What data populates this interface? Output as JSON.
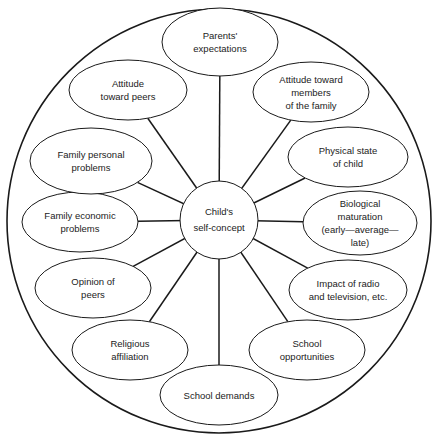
{
  "diagram": {
    "type": "radial-influence-diagram",
    "center": {
      "label": "Child's\nself-concept",
      "cx": 219,
      "cy": 220,
      "r": 39
    },
    "outer_circle": {
      "cx": 219,
      "cy": 221,
      "r": 212
    },
    "colors": {
      "stroke": "#1a1a1a",
      "fill": "#ffffff",
      "text": "#222222"
    },
    "nodes": [
      {
        "id": "parents-expectations",
        "label": "Parents'\nexpectations",
        "cx": 220,
        "cy": 42,
        "rx": 58,
        "ry": 34
      },
      {
        "id": "attitude-toward-members-family",
        "label": "Attitude toward\nmembers\nof the family",
        "cx": 311,
        "cy": 92,
        "rx": 58,
        "ry": 30
      },
      {
        "id": "physical-state-child",
        "label": "Physical state\nof child",
        "cx": 348,
        "cy": 157,
        "rx": 60,
        "ry": 30
      },
      {
        "id": "biological-maturation",
        "label": "Biological\nmaturation\n(early—average—\nlate)",
        "cx": 360,
        "cy": 223,
        "rx": 57,
        "ry": 32
      },
      {
        "id": "impact-radio-television",
        "label": "Impact of radio\nand television, etc.",
        "cx": 348,
        "cy": 290,
        "rx": 59,
        "ry": 30
      },
      {
        "id": "school-opportunities",
        "label": "School\nopportunities",
        "cx": 307,
        "cy": 350,
        "rx": 58,
        "ry": 30
      },
      {
        "id": "school-demands",
        "label": "School demands",
        "cx": 219,
        "cy": 395,
        "rx": 59,
        "ry": 30
      },
      {
        "id": "religious-affiliation",
        "label": "Religious\naffiliation",
        "cx": 130,
        "cy": 350,
        "rx": 58,
        "ry": 30
      },
      {
        "id": "opinion-of-peers",
        "label": "Opinion of\npeers",
        "cx": 93,
        "cy": 288,
        "rx": 58,
        "ry": 30
      },
      {
        "id": "family-economic-problems",
        "label": "Family economic\nproblems",
        "cx": 80,
        "cy": 222,
        "rx": 58,
        "ry": 30
      },
      {
        "id": "family-personal-problems",
        "label": "Family personal\nproblems",
        "cx": 91,
        "cy": 161,
        "rx": 61,
        "ry": 33
      },
      {
        "id": "attitude-toward-peers",
        "label": "Attitude\ntoward peers",
        "cx": 128,
        "cy": 90,
        "rx": 59,
        "ry": 30
      }
    ]
  }
}
